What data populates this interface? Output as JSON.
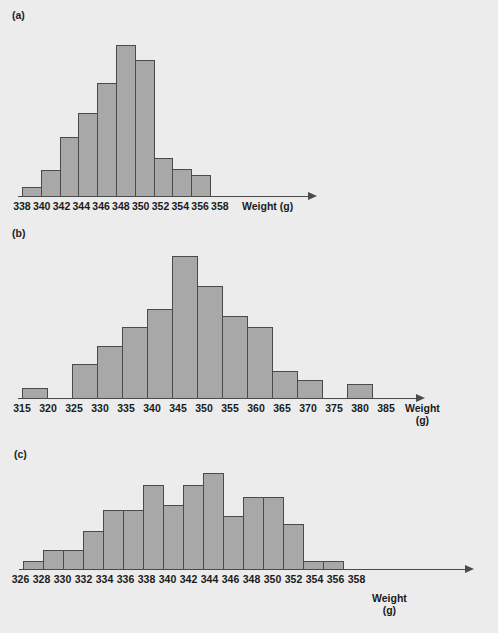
{
  "figure": {
    "background_color": "#ececec",
    "bar_fill": "#a8a8a8",
    "bar_stroke": "#4a4a4a"
  },
  "panels": [
    {
      "key": "a",
      "label": "(a)",
      "axis_title": "Weight (g)",
      "axis_title_line1": "Weight (g)",
      "axis_title_line2": ""
    },
    {
      "key": "b",
      "label": "(b)",
      "axis_title": "Weight (g)",
      "axis_title_line1": "Weight",
      "axis_title_line2": "(g)"
    },
    {
      "key": "c",
      "label": "(c)",
      "axis_title": "Weight (g)",
      "axis_title_line1": "Weight",
      "axis_title_line2": "(g)"
    }
  ],
  "chart_data": [
    {
      "type": "bar",
      "panel": "a",
      "title": "(a)",
      "xlabel": "Weight (g)",
      "ylabel": "",
      "grid": false,
      "legend": "none",
      "bin_width": 2,
      "tick_labels": [
        "338",
        "340",
        "342",
        "344",
        "346",
        "348",
        "350",
        "352",
        "354",
        "356",
        "358"
      ],
      "bin_edges": [
        338,
        340,
        342,
        344,
        346,
        348,
        350,
        352,
        354,
        356,
        358
      ],
      "categories": [
        "338-340",
        "340-342",
        "342-344",
        "344-346",
        "346-348",
        "348-350",
        "350-352",
        "352-354",
        "354-356",
        "356-358"
      ],
      "values": [
        6,
        17,
        39,
        55,
        75,
        100,
        90,
        25,
        18,
        14
      ],
      "ylim": [
        0,
        110
      ]
    },
    {
      "type": "bar",
      "panel": "b",
      "title": "(b)",
      "xlabel": "Weight (g)",
      "ylabel": "",
      "grid": false,
      "legend": "none",
      "bin_width": 5,
      "tick_labels": [
        "315",
        "320",
        "325",
        "330",
        "335",
        "340",
        "345",
        "350",
        "355",
        "360",
        "365",
        "370",
        "375",
        "380",
        "385"
      ],
      "bin_edges": [
        315,
        320,
        325,
        330,
        335,
        340,
        345,
        350,
        355,
        360,
        365,
        370,
        375,
        380,
        385
      ],
      "categories": [
        "315-320",
        "320-325",
        "325-330",
        "330-335",
        "335-340",
        "340-345",
        "345-350",
        "350-355",
        "355-360",
        "360-365",
        "365-370",
        "370-375",
        "375-380",
        "380-385"
      ],
      "values": [
        7,
        0,
        24,
        37,
        50,
        63,
        100,
        79,
        58,
        50,
        19,
        13,
        0,
        10
      ],
      "ylim": [
        0,
        110
      ]
    },
    {
      "type": "bar",
      "panel": "c",
      "title": "(c)",
      "xlabel": "Weight (g)",
      "ylabel": "",
      "grid": false,
      "legend": "none",
      "bin_width": 2,
      "tick_labels": [
        "326",
        "328",
        "330",
        "332",
        "334",
        "336",
        "338",
        "340",
        "342",
        "344",
        "346",
        "348",
        "350",
        "352",
        "354",
        "356",
        "358"
      ],
      "bin_edges": [
        326,
        328,
        330,
        332,
        334,
        336,
        338,
        340,
        342,
        344,
        346,
        348,
        350,
        352,
        354,
        356,
        358
      ],
      "categories": [
        "326-328",
        "328-330",
        "330-332",
        "332-334",
        "334-336",
        "336-338",
        "338-340",
        "340-342",
        "342-344",
        "344-346",
        "346-348",
        "348-350",
        "350-352",
        "352-354",
        "354-356",
        "356-358"
      ],
      "values": [
        8,
        20,
        20,
        39,
        61,
        61,
        87,
        66,
        87,
        100,
        55,
        75,
        75,
        47,
        8,
        8
      ],
      "ylim": [
        0,
        110
      ]
    }
  ]
}
